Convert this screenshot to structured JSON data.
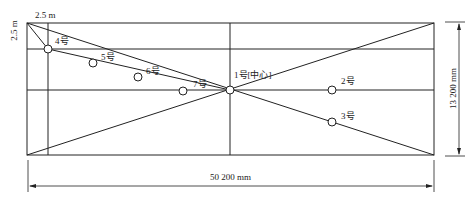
{
  "diagram": {
    "dimensions": {
      "length": "50 200 mm",
      "width": "13 200 mm",
      "offset_x": "2.5 m",
      "offset_y": "2.5 m"
    },
    "points": [
      {
        "id": "p1",
        "label": "1号[中心]",
        "x": 230,
        "y": 90
      },
      {
        "id": "p2",
        "label": "2号",
        "x": 332,
        "y": 90
      },
      {
        "id": "p3",
        "label": "3号",
        "x": 332,
        "y": 122
      },
      {
        "id": "p4",
        "label": "4号",
        "x": 48,
        "y": 49
      },
      {
        "id": "p5",
        "label": "5号",
        "x": 93,
        "y": 63
      },
      {
        "id": "p6",
        "label": "6号",
        "x": 138,
        "y": 77
      },
      {
        "id": "p7",
        "label": "7号",
        "x": 183,
        "y": 91
      }
    ],
    "line_color": "#222222"
  }
}
